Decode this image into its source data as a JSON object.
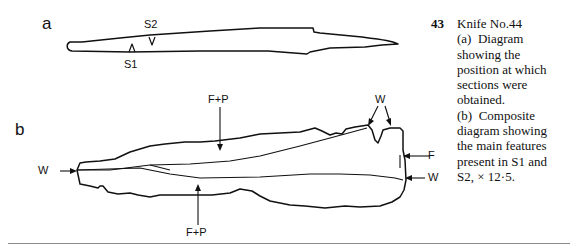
{
  "figure": {
    "panel_a": {
      "label": "a",
      "section_markers": [
        "S1",
        "S2"
      ]
    },
    "panel_b": {
      "label": "b",
      "annotations": {
        "f_p_top": "F+P",
        "f_p_bottom": "F+P",
        "w_left": "W",
        "w_top": "W",
        "f_right": "F",
        "w_right": "W"
      }
    }
  },
  "caption": {
    "number": "43",
    "lines": [
      "Knife No.44",
      "(a)  Diagram",
      "showing the",
      "position at which",
      "sections were",
      "obtained.",
      "(b)  Composite",
      "diagram showing",
      "the main features",
      "present in S1 and",
      "S2, × 12·5."
    ]
  }
}
